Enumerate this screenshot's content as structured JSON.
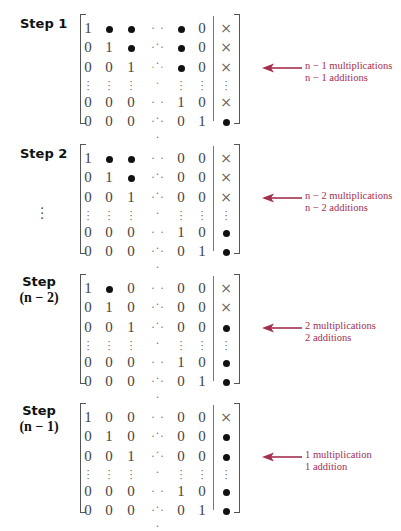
{
  "figure": {
    "steps": [
      {
        "label": "Step 1",
        "label_sub": "",
        "show_vdots": false,
        "rows": [
          [
            "1",
            "•",
            "•",
            "⋯",
            "•",
            "0",
            "×"
          ],
          [
            "0",
            "1",
            "•",
            "⋯",
            "•",
            "0",
            "×"
          ],
          [
            "0",
            "0",
            "1",
            "⋯",
            "•",
            "0",
            "×"
          ],
          [
            "⋮",
            "⋮",
            "⋮",
            "",
            "⋮",
            "⋮",
            "⋮"
          ],
          [
            "0",
            "0",
            "0",
            "⋯",
            "1",
            "0",
            "×"
          ],
          [
            "0",
            "0",
            "0",
            "⋯",
            "0",
            "1",
            "•"
          ]
        ],
        "note_line1": "n − 1 multiplications",
        "note_line2": "n − 1 additions"
      },
      {
        "label": "Step 2",
        "label_sub": "",
        "show_vdots": true,
        "rows": [
          [
            "1",
            "•",
            "•",
            "⋯",
            "0",
            "0",
            "×"
          ],
          [
            "0",
            "1",
            "•",
            "⋯",
            "0",
            "0",
            "×"
          ],
          [
            "0",
            "0",
            "1",
            "⋯",
            "0",
            "0",
            "×"
          ],
          [
            "⋮",
            "⋮",
            "⋮",
            "",
            "⋮",
            "⋮",
            "⋮"
          ],
          [
            "0",
            "0",
            "0",
            "⋯",
            "1",
            "0",
            "•"
          ],
          [
            "0",
            "0",
            "0",
            "⋯",
            "0",
            "1",
            "•"
          ]
        ],
        "note_line1": "n − 2 multiplications",
        "note_line2": "n − 2 additions"
      },
      {
        "label": "Step",
        "label_sub": "(n − 2)",
        "show_vdots": false,
        "rows": [
          [
            "1",
            "•",
            "0",
            "⋯",
            "0",
            "0",
            "×"
          ],
          [
            "0",
            "1",
            "0",
            "⋯",
            "0",
            "0",
            "×"
          ],
          [
            "0",
            "0",
            "1",
            "⋯",
            "0",
            "0",
            "•"
          ],
          [
            "⋮",
            "⋮",
            "⋮",
            "",
            "⋮",
            "⋮",
            "⋮"
          ],
          [
            "0",
            "0",
            "0",
            "⋯",
            "1",
            "0",
            "•"
          ],
          [
            "0",
            "0",
            "0",
            "⋯",
            "0",
            "1",
            "•"
          ]
        ],
        "note_line1": "2 multiplications",
        "note_line2": "2 additions"
      },
      {
        "label": "Step",
        "label_sub": "(n − 1)",
        "show_vdots": false,
        "rows": [
          [
            "1",
            "0",
            "0",
            "⋯",
            "0",
            "0",
            "×"
          ],
          [
            "0",
            "1",
            "0",
            "⋯",
            "0",
            "0",
            "•"
          ],
          [
            "0",
            "0",
            "1",
            "⋯",
            "0",
            "0",
            "•"
          ],
          [
            "⋮",
            "⋮",
            "⋮",
            "",
            "⋮",
            "⋮",
            "⋮"
          ],
          [
            "0",
            "0",
            "0",
            "⋯",
            "1",
            "0",
            "•"
          ],
          [
            "0",
            "0",
            "0",
            "⋯",
            "0",
            "1",
            "•"
          ]
        ],
        "note_line1": "1 multiplication",
        "note_line2": "1 addition"
      }
    ],
    "colors": {
      "annotation": "#a3304f",
      "arrow": "#a3304f",
      "text": "#444444"
    },
    "icons": {
      "arrow": "left-arrow-icon",
      "filled": "bullet-icon",
      "cross": "cross-icon"
    }
  }
}
